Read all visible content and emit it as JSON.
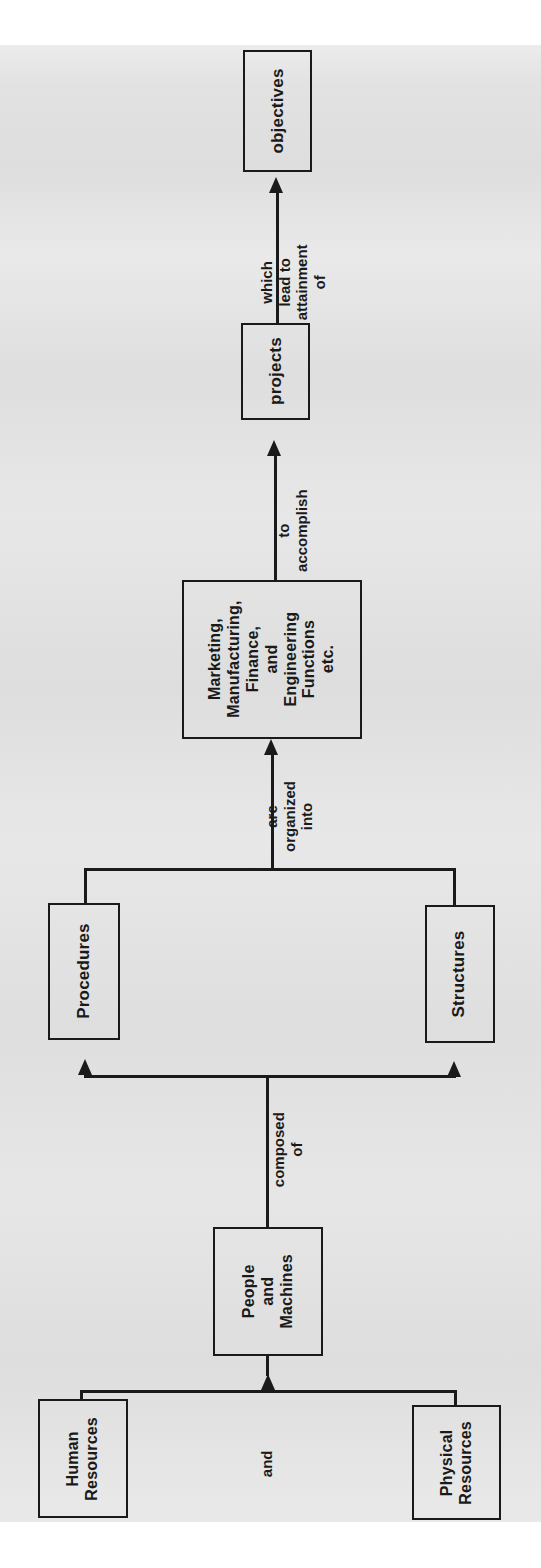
{
  "page": {
    "orientation": "rotated-90-ccw",
    "background_color": "#e2e2e2",
    "ink_color": "#1a1a1a",
    "media": "scanned book page"
  },
  "diagram": {
    "type": "flowchart",
    "direction": "bottom-to-top (as printed: left-to-right)",
    "nodes": [
      {
        "id": "objectives",
        "label": "objectives"
      },
      {
        "id": "projects",
        "label": "projects"
      },
      {
        "id": "functions",
        "label": "Marketing,\nManufacturing,\nFinance,\nand\nEngineering\nFunctions\netc."
      },
      {
        "id": "procedures",
        "label": "Procedures"
      },
      {
        "id": "structures",
        "label": "Structures"
      },
      {
        "id": "people",
        "label": "People\nand\nMachines"
      },
      {
        "id": "human",
        "label": "Human\nResources"
      },
      {
        "id": "physical",
        "label": "Physical\nResources"
      }
    ],
    "edge_labels": [
      {
        "id": "lead-to",
        "from": "projects",
        "to": "objectives",
        "text": "which\nlead to\nattainment\nof"
      },
      {
        "id": "accomplish",
        "from": "functions",
        "to": "projects",
        "text": "to\naccomplish"
      },
      {
        "id": "organized",
        "from": "procedures-structures",
        "to": "functions",
        "text": "are\norganized\ninto"
      },
      {
        "id": "composed-of",
        "from": "people",
        "to": "procedures-structures",
        "text": "composed\nof"
      },
      {
        "id": "and",
        "from": "human-physical",
        "to": "people",
        "text": "and"
      }
    ]
  },
  "labels": {
    "objectives": "objectives",
    "projects": "projects",
    "functions_l1": "Marketing,",
    "functions_l2": "Manufacturing,",
    "functions_l3": "Finance,",
    "functions_l4": "and",
    "functions_l5": "Engineering",
    "functions_l6": "Functions",
    "functions_l7": "etc.",
    "procedures": "Procedures",
    "structures": "Structures",
    "people_l1": "People",
    "people_l2": "and",
    "people_l3": "Machines",
    "human_l1": "Human",
    "human_l2": "Resources",
    "physical_l1": "Physical",
    "physical_l2": "Resources",
    "edge_lead_l1": "which",
    "edge_lead_l2": "lead to",
    "edge_lead_l3": "attainment",
    "edge_lead_l4": "of",
    "edge_accomplish_l1": "to",
    "edge_accomplish_l2": "accomplish",
    "edge_organized_l1": "are",
    "edge_organized_l2": "organized",
    "edge_organized_l3": "into",
    "edge_composed_l1": "composed",
    "edge_composed_l2": "of",
    "edge_and": "and"
  }
}
